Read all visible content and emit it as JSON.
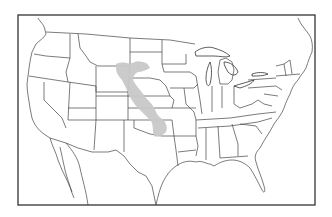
{
  "map": {
    "subject": "Contiguous United States with state borders",
    "overlay": {
      "name": "Italy",
      "description": "Silhouette of Italy overlaid for size comparison, spanning Wyoming, South Dakota, Nebraska and Kansas",
      "color": "#c8c8c8"
    },
    "colors": {
      "background": "#ffffff",
      "stroke": "#333333",
      "frame": "#333333"
    },
    "frame": {
      "x": 18,
      "y": 15,
      "width": 297,
      "height": 190
    }
  }
}
